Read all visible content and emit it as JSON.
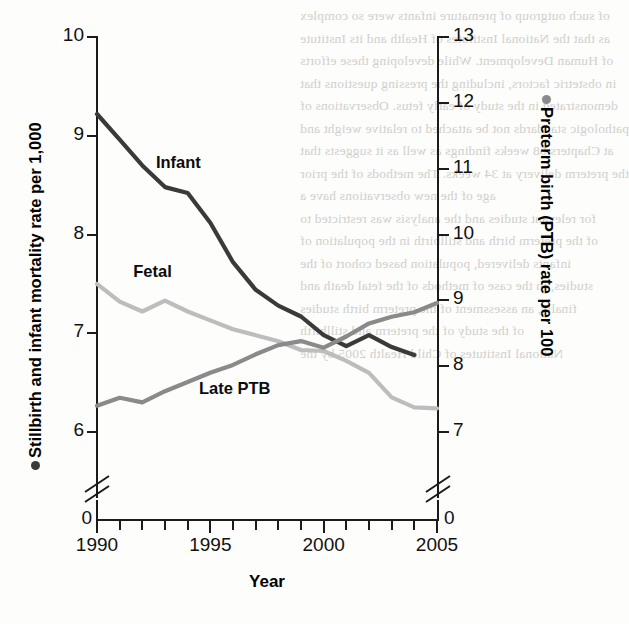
{
  "chart_data": {
    "type": "line",
    "title": "",
    "xlabel": "Year",
    "ylabel_left": "Stillbirth and infant mortality rate per 1,000",
    "ylabel_right": "Preterm birth (PTB) rate per 100",
    "x": [
      1990,
      1991,
      1992,
      1993,
      1994,
      1995,
      1996,
      1997,
      1998,
      1999,
      2000,
      2001,
      2002,
      2003,
      2004,
      2005
    ],
    "xlim": [
      1990,
      2005
    ],
    "xticks_major": [
      "1990",
      "1995",
      "2000",
      "2005"
    ],
    "xticks_major_values": [
      1990,
      1995,
      2000,
      2005
    ],
    "xticks_minor_values": [
      1991,
      1992,
      1993,
      1994,
      1996,
      1997,
      1998,
      1999,
      2001,
      2002,
      2003,
      2004
    ],
    "ylim_left": [
      6,
      10
    ],
    "yticks_left": [
      "6",
      "7",
      "8",
      "9",
      "10"
    ],
    "yticks_left_values": [
      6,
      7,
      8,
      9,
      10
    ],
    "ylim_right": [
      7,
      13
    ],
    "yticks_right": [
      "7",
      "8",
      "9",
      "10",
      "11",
      "12",
      "13"
    ],
    "yticks_right_values": [
      7,
      8,
      9,
      10,
      11,
      12,
      13
    ],
    "axis_break": true,
    "axis_origin_label": "0",
    "grid": false,
    "legend": "inline-labels",
    "series": [
      {
        "name": "Infant",
        "axis": "left",
        "color": "#3a3a3a",
        "label_x": 1992.6,
        "label_y": 8.72,
        "values": [
          9.22,
          8.96,
          8.7,
          8.48,
          8.42,
          8.12,
          7.72,
          7.44,
          7.28,
          7.17,
          6.98,
          6.87,
          6.98,
          6.86,
          6.78,
          null
        ]
      },
      {
        "name": "Fetal",
        "axis": "left",
        "color": "#bdbdbd",
        "label_x": 1991.6,
        "label_y": 7.62,
        "values": [
          7.5,
          7.32,
          7.22,
          7.33,
          7.22,
          7.13,
          7.04,
          6.98,
          6.92,
          6.83,
          6.82,
          6.72,
          6.6,
          6.35,
          6.25,
          6.24
        ]
      },
      {
        "name": "Late PTB",
        "axis": "right",
        "color": "#8a8a8a",
        "label_x": 1994.5,
        "label_y": 7.66,
        "values": [
          7.4,
          7.52,
          7.45,
          7.62,
          7.76,
          7.9,
          8.02,
          8.18,
          8.32,
          8.38,
          8.28,
          8.45,
          8.65,
          8.75,
          8.82,
          8.96
        ]
      }
    ]
  },
  "bleed_text": {
    "lines": [
      "of such outgroup of premature infants were so complex",
      "as that the National Institutes of Health and its Institute",
      "of Human Development.  While developing these efforts",
      "in obstetric factors, including the pressing questions that",
      "demonstrated in the study of early fetus.  Observations of",
      "pathologic standards not be attached to relative weight and",
      "at Chapters 68  weeks  findings as well as it suggests that",
      "the preterm delivery at 34 weeks.  The methods of the prior",
      "age of the new observations have a",
      "for relevant studies and the analysis was restricted to",
      "of the preterm birth and stillbirth in the population of",
      "infants delivered, population based cohort of the",
      "studies, in the case of methods of the fetal death and",
      "finally, an assessment of the preterm birth studies",
      "of the study of the preterm and stillbirth",
      "National Institutes of Child Health 2005 by the"
    ]
  }
}
